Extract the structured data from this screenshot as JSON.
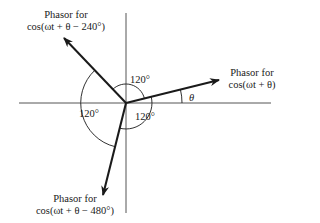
{
  "diagram": {
    "type": "phasor-diagram",
    "origin": [
      126,
      103
    ],
    "colors": {
      "line": "#1a1a1a",
      "axis": "#555555",
      "background": "#ffffff"
    },
    "phasors": [
      {
        "id": "phasor-0",
        "label_line1": "Phasor for",
        "label_line2": "cos(ωt + θ)",
        "angle_deg": 11
      },
      {
        "id": "phasor-240",
        "label_line1": "Phasor for",
        "label_line2": "cos(ωt + θ − 240°)",
        "angle_deg": 131
      },
      {
        "id": "phasor-480",
        "label_line1": "Phasor for",
        "label_line2": "cos(ωt + θ − 480°)",
        "angle_deg": 251
      }
    ],
    "angles": {
      "top": "120°",
      "left": "120°",
      "bottom": "120°",
      "theta": "θ"
    }
  }
}
